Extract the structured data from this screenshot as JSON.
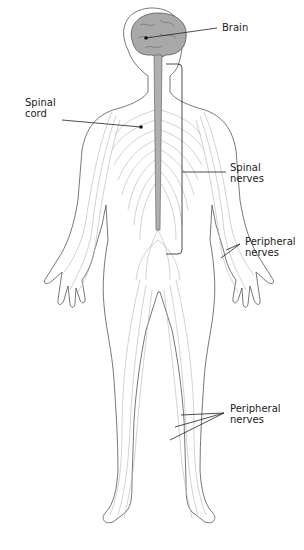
{
  "diagram": {
    "colors": {
      "background": "#ffffff",
      "outline": "#555555",
      "nerves": "#b5b5b5",
      "brain_fill": "#a9a9a9",
      "spinal_cord_fill": "#b0b0b0",
      "leader_lines": "#222222"
    },
    "labels": {
      "brain": "Brain",
      "spinal_cord": "Spinal\ncord",
      "spinal_nerves": "Spinal\nnerves",
      "peripheral_nerves_arm": "Peripheral\nnerves",
      "peripheral_nerves_leg": "Peripheral\nnerves"
    }
  }
}
